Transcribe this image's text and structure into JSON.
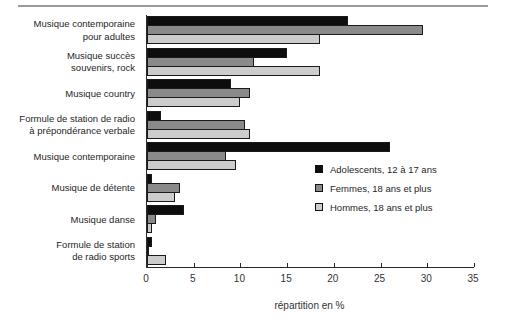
{
  "figure": {
    "top_rule_color": "#9b9b9b",
    "background": "#ffffff"
  },
  "chart_data": {
    "type": "bar",
    "orientation": "horizontal",
    "title": "",
    "xlabel": "répartition en %",
    "ylabel": "",
    "xlim": [
      0,
      35
    ],
    "xticks": [
      0,
      5,
      10,
      15,
      20,
      25,
      30,
      35
    ],
    "grid": false,
    "legend_position": "middle-right-inside",
    "categories": [
      "Musique contemporaine pour adultes",
      "Musique succès souvenirs, rock",
      "Musique country",
      "Formule de station de radio à prépondérance verbale",
      "Musique contemporaine",
      "Musique de détente",
      "Musique danse",
      "Formule de station de radio sports"
    ],
    "category_label_lines": [
      [
        "Musique contemporaine",
        "pour adultes"
      ],
      [
        "Musique succès",
        "souvenirs, rock"
      ],
      [
        "Musique country"
      ],
      [
        "Formule de station de radio",
        "à prépondérance verbale"
      ],
      [
        "Musique contemporaine"
      ],
      [
        "Musique de détente"
      ],
      [
        "Musique danse"
      ],
      [
        "Formule de station",
        "de radio sports"
      ]
    ],
    "series": [
      {
        "name": "Adolescents, 12 à 17 ans",
        "color": "#0d0d0d",
        "values": [
          21.5,
          15,
          9,
          1.5,
          26,
          0.5,
          4,
          0.5
        ]
      },
      {
        "name": "Femmes, 18 ans et plus",
        "color": "#8a8a8a",
        "values": [
          29.5,
          11.5,
          11,
          10.5,
          8.5,
          3.5,
          1,
          0.2
        ]
      },
      {
        "name": "Hommes, 18 ans et plus",
        "color": "#cccccc",
        "values": [
          18.5,
          18.5,
          10,
          11,
          9.5,
          3,
          0.5,
          2
        ]
      }
    ]
  }
}
